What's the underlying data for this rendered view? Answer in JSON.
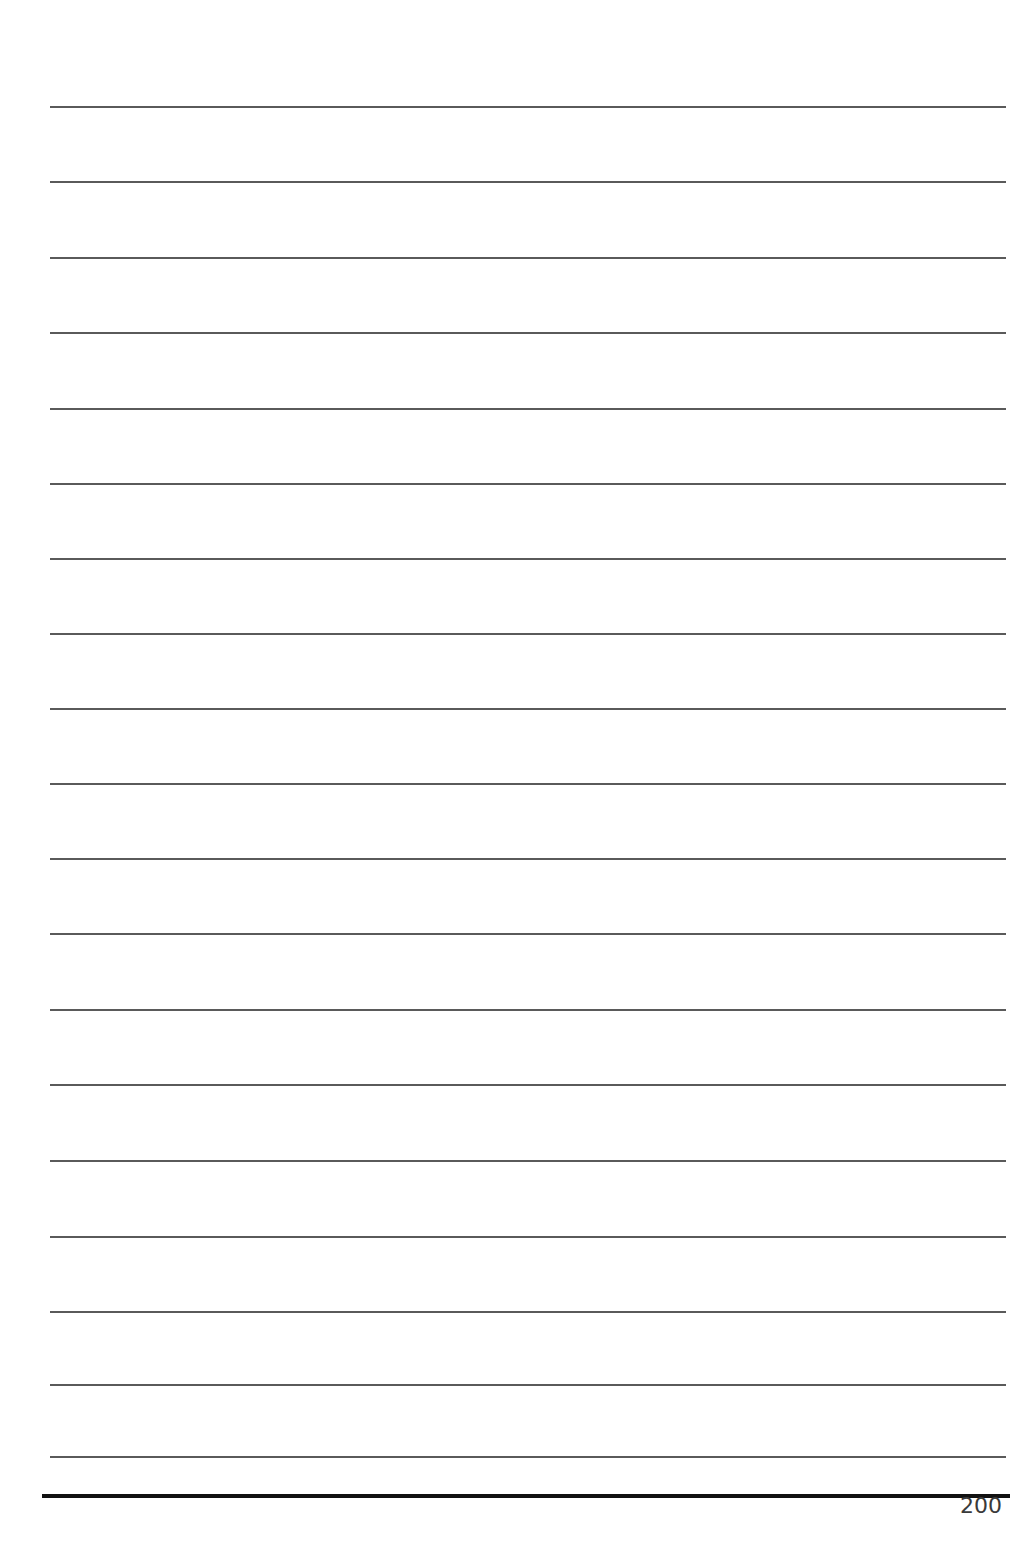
{
  "page": {
    "type": "lined-notebook-page",
    "page_number": "200",
    "rules": {
      "count": 19,
      "x_start": 50,
      "x_end": 1006,
      "y_positions": [
        107,
        182,
        258,
        333,
        409,
        484,
        559,
        634,
        709,
        784,
        859,
        934,
        1010,
        1085,
        1161,
        1237,
        1312,
        1385,
        1457
      ],
      "color": "#5a5a5a"
    },
    "baseline": {
      "y": 1496,
      "color": "#111111"
    }
  }
}
